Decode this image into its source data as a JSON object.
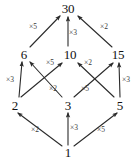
{
  "diagram": {
    "type": "hasse-diagram",
    "background_color": "#ffffff",
    "stroke_color": "#2b2b2b",
    "label_color": "#111111",
    "edge_label_color": "#3a3a3a",
    "nodes": [
      {
        "id": "n30",
        "label": "30",
        "x": 68,
        "y": 8,
        "level": 3
      },
      {
        "id": "n6",
        "label": "6",
        "x": 24,
        "y": 54,
        "level": 2
      },
      {
        "id": "n10",
        "label": "10",
        "x": 70,
        "y": 54,
        "level": 2
      },
      {
        "id": "n15",
        "label": "15",
        "x": 118,
        "y": 54,
        "level": 2
      },
      {
        "id": "n2",
        "label": "2",
        "x": 15,
        "y": 105,
        "level": 1
      },
      {
        "id": "n3",
        "label": "3",
        "x": 68,
        "y": 105,
        "level": 1
      },
      {
        "id": "n5",
        "label": "5",
        "x": 120,
        "y": 105,
        "level": 1
      },
      {
        "id": "n1",
        "label": "1",
        "x": 68,
        "y": 152,
        "level": 0
      }
    ],
    "edges": [
      {
        "id": "e-6-30",
        "from": "n6",
        "to": "n30",
        "label": "×5",
        "lx": 33,
        "ly": 27,
        "x1": 30,
        "y1": 47,
        "x2": 60,
        "y2": 16
      },
      {
        "id": "e-10-30",
        "from": "n10",
        "to": "n30",
        "label": "×3",
        "lx": 73,
        "ly": 33,
        "x1": 68,
        "y1": 46,
        "x2": 68,
        "y2": 17
      },
      {
        "id": "e-15-30",
        "from": "n15",
        "to": "n30",
        "label": "×2",
        "lx": 104,
        "ly": 27,
        "x1": 112,
        "y1": 47,
        "x2": 78,
        "y2": 16
      },
      {
        "id": "e-2-6",
        "from": "n2",
        "to": "n6",
        "label": "×3",
        "lx": 10,
        "ly": 80,
        "x1": 19,
        "y1": 97,
        "x2": 22,
        "y2": 62
      },
      {
        "id": "e-3-6",
        "from": "n3",
        "to": "n6",
        "label": "×2",
        "lx": 53,
        "ly": 89,
        "x1": 62,
        "y1": 97,
        "x2": 30,
        "y2": 62
      },
      {
        "id": "e-2-10",
        "from": "n2",
        "to": "n10",
        "label": "×5",
        "lx": 50,
        "ly": 63,
        "x1": 21,
        "y1": 97,
        "x2": 62,
        "y2": 63
      },
      {
        "id": "e-5-10",
        "from": "n5",
        "to": "n10",
        "label": "×5",
        "lx": 85,
        "ly": 89,
        "x1": 114,
        "y1": 97,
        "x2": 78,
        "y2": 63
      },
      {
        "id": "e-3-15",
        "from": "n3",
        "to": "n15",
        "label": "×2",
        "lx": 88,
        "ly": 63,
        "x1": 74,
        "y1": 97,
        "x2": 113,
        "y2": 63
      },
      {
        "id": "e-5-15",
        "from": "n5",
        "to": "n15",
        "label": "×3",
        "lx": 126,
        "ly": 80,
        "x1": 120,
        "y1": 97,
        "x2": 119,
        "y2": 63
      },
      {
        "id": "e-1-2",
        "from": "n1",
        "to": "n2",
        "label": "×2",
        "lx": 35,
        "ly": 130,
        "x1": 62,
        "y1": 146,
        "x2": 18,
        "y2": 113
      },
      {
        "id": "e-1-3",
        "from": "n1",
        "to": "n3",
        "label": "×3",
        "lx": 74,
        "ly": 128,
        "x1": 68,
        "y1": 145,
        "x2": 68,
        "y2": 113
      },
      {
        "id": "e-1-5",
        "from": "n1",
        "to": "n5",
        "label": "×5",
        "lx": 101,
        "ly": 130,
        "x1": 74,
        "y1": 146,
        "x2": 117,
        "y2": 113
      }
    ]
  }
}
